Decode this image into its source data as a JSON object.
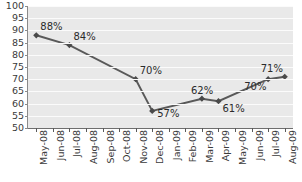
{
  "chart_data": {
    "type": "line",
    "title": "",
    "subtitle": "",
    "xlabel": "",
    "ylabel": "",
    "ylim": [
      50,
      100
    ],
    "ytick_step": 5,
    "yticks": [
      100,
      95,
      90,
      85,
      80,
      75,
      70,
      65,
      60,
      55,
      50
    ],
    "grid": true,
    "grid_orientation": "horizontal",
    "legend": null,
    "legend_position": "none",
    "categories": [
      "May-08",
      "Jun-08",
      "Jul-08",
      "Aug-08",
      "Sep-08",
      "Oct-08",
      "Nov-08",
      "Dec-08",
      "Jan-09",
      "Feb-09",
      "Mar-09",
      "Apr-09",
      "May-09",
      "Jun-09",
      "Jul-09",
      "Aug-09"
    ],
    "series": [
      {
        "name": "",
        "marker": "diamond",
        "color": "#595959",
        "points": [
          {
            "x": "May-08",
            "value": 88,
            "label": "88%",
            "label_position": "above-right"
          },
          {
            "x": "Jul-08",
            "value": 84,
            "label": "84%",
            "label_position": "above-right"
          },
          {
            "x": "Nov-08",
            "value": 70,
            "label": "70%",
            "label_position": "above-right"
          },
          {
            "x": "Dec-08",
            "value": 57,
            "label": "57%",
            "label_position": "right"
          },
          {
            "x": "Mar-09",
            "value": 62,
            "label": "62%",
            "label_position": "above"
          },
          {
            "x": "Apr-09",
            "value": 61,
            "label": "61%",
            "label_position": "below-right"
          },
          {
            "x": "Jul-09",
            "value": 70,
            "label": "70%",
            "label_position": "below-left"
          },
          {
            "x": "Aug-09",
            "value": 71,
            "label": "71%",
            "label_position": "above-left"
          }
        ]
      }
    ],
    "colors": {
      "line": "#595959",
      "marker": "#4a4a4a",
      "plot_background": "#e9e9e9",
      "gridline": "#fbfbfb",
      "axis": "#6e6e6e",
      "text": "#3a3a3a"
    }
  },
  "axis": {
    "y_tick_labels": [
      "100",
      "95",
      "90",
      "85",
      "80",
      "75",
      "70",
      "65",
      "60",
      "55",
      "50"
    ],
    "x_tick_labels": [
      "May-08",
      "Jun-08",
      "Jul-08",
      "Aug-08",
      "Sep-08",
      "Oct-08",
      "Nov-08",
      "Dec-08",
      "Jan-09",
      "Feb-09",
      "Mar-09",
      "Apr-09",
      "May-09",
      "Jun-09",
      "Jul-09",
      "Aug-09"
    ]
  },
  "data_labels": [
    "88%",
    "84%",
    "70%",
    "57%",
    "62%",
    "61%",
    "70%",
    "71%"
  ]
}
